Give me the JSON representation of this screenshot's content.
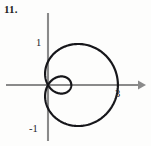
{
  "figure": {
    "problem_number": "11.",
    "axes": {
      "origin_px": [
        48,
        85
      ],
      "units_per_pixel": 23.3,
      "x_axis_label": "",
      "y_axis_label": "",
      "x_arrow": "right-arrow-icon",
      "y_arrow": "none"
    },
    "tick_labels": [
      {
        "text": "1",
        "axis": "y",
        "value": 1,
        "px": [
          39,
          42
        ]
      },
      {
        "text": "-1",
        "axis": "y",
        "value": -1,
        "px": [
          32,
          128
        ]
      },
      {
        "text": "3",
        "axis": "x",
        "value": 3,
        "px": [
          118,
          93
        ]
      }
    ],
    "colors": {
      "curve": "#16161a",
      "axis": "#8a8a8a",
      "label": "#23232a",
      "background": "#fdfdfc"
    }
  },
  "chart_data": {
    "type": "line",
    "title": "",
    "subtitle": "",
    "xlabel": "",
    "ylabel": "",
    "coordinate_system": "polar",
    "curve_name": "limacon-with-inner-loop",
    "equation": "r = 1 + 2 cos(theta)",
    "parameters": {
      "a": 1,
      "b": 2
    },
    "theta_range_deg": [
      0,
      360
    ],
    "xlim": [
      -0.45,
      3.2
    ],
    "ylim": [
      -2.35,
      2.35
    ],
    "grid": false,
    "legend": false,
    "annotations": [
      "1",
      "-1",
      "3"
    ],
    "key_points": [
      {
        "theta_deg": 0,
        "r": 3,
        "x": 3,
        "y": 0
      },
      {
        "theta_deg": 60,
        "r": 2,
        "x": 1,
        "y": 1.732
      },
      {
        "theta_deg": 90,
        "r": 1,
        "x": 0,
        "y": 1
      },
      {
        "theta_deg": 120,
        "r": 0,
        "x": 0,
        "y": 0
      },
      {
        "theta_deg": 180,
        "r": -1,
        "x": 1,
        "y": 0
      },
      {
        "theta_deg": 240,
        "r": 0,
        "x": 0,
        "y": 0
      },
      {
        "theta_deg": 270,
        "r": 1,
        "x": 0,
        "y": -1
      },
      {
        "theta_deg": 300,
        "r": 2,
        "x": 1,
        "y": -1.732
      }
    ],
    "series": [
      {
        "name": "outer-loop",
        "theta_deg": [
          0,
          15,
          30,
          45,
          60,
          75,
          90,
          105,
          120,
          240,
          255,
          270,
          285,
          300,
          315,
          330,
          345,
          360
        ],
        "r": [
          3.0,
          2.932,
          2.732,
          2.414,
          2.0,
          1.518,
          1.0,
          0.482,
          0.0,
          0.0,
          0.482,
          1.0,
          1.518,
          2.0,
          2.414,
          2.732,
          2.932,
          3.0
        ]
      },
      {
        "name": "inner-loop",
        "theta_deg": [
          120,
          135,
          150,
          165,
          180,
          195,
          210,
          225,
          240
        ],
        "r": [
          0.0,
          -0.414,
          -0.732,
          -0.932,
          -1.0,
          -0.932,
          -0.732,
          -0.414,
          0.0
        ]
      }
    ]
  }
}
